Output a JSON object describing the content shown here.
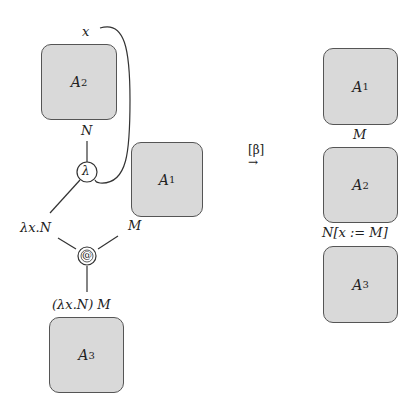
{
  "left": {
    "boxes": {
      "a2": {
        "name": "A",
        "sub": "2"
      },
      "a1": {
        "name": "A",
        "sub": "1"
      },
      "a3": {
        "name": "A",
        "sub": "3"
      }
    },
    "labels": {
      "x": "x",
      "n": "N",
      "lambda_node": "λ",
      "app_node": "@",
      "lambda_term": "λx.N",
      "m": "M",
      "app_term": "(λx.N) M"
    }
  },
  "arrow": {
    "label": "[β]",
    "symbol": "→"
  },
  "right": {
    "boxes": {
      "a1": {
        "name": "A",
        "sub": "1"
      },
      "a2": {
        "name": "A",
        "sub": "2"
      },
      "a3": {
        "name": "A",
        "sub": "3"
      }
    },
    "labels": {
      "m": "M",
      "subst": "N[x := M]"
    }
  }
}
